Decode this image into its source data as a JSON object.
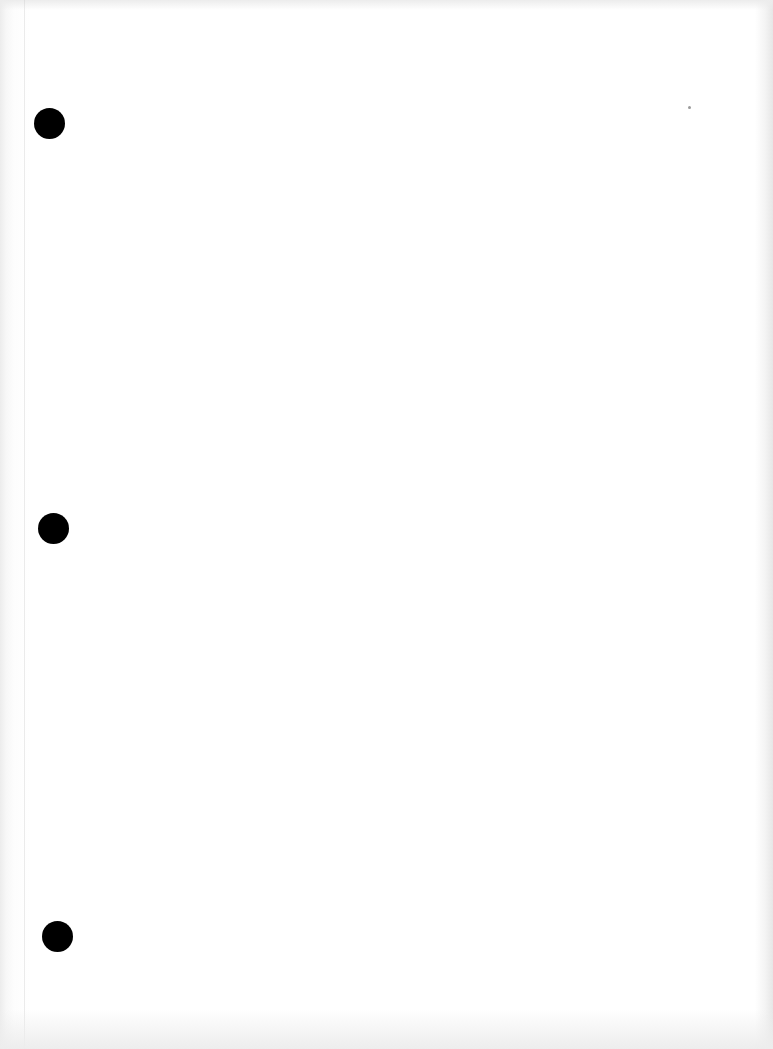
{
  "document": {
    "type": "blank three-hole punched sheet",
    "text": "",
    "background_color": "#ffffff",
    "hole_color": "#000000",
    "punch_holes": [
      {
        "id": "top",
        "cx": 49,
        "cy": 123,
        "diameter": 31
      },
      {
        "id": "middle",
        "cx": 53,
        "cy": 528,
        "diameter": 31
      },
      {
        "id": "bottom",
        "cx": 57,
        "cy": 936,
        "diameter": 31
      }
    ]
  }
}
